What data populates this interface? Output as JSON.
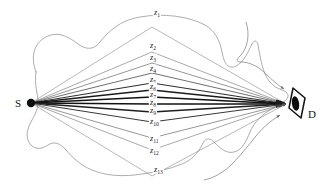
{
  "figure": {
    "type": "multipath-propagation-diagram",
    "background_color": "#ffffff",
    "ink_color": "#141414",
    "contour_color": "#8a8a8a"
  },
  "nodes": {
    "source": {
      "label": "S",
      "name": "source-node",
      "shape": "filled-dot",
      "x": 31,
      "y": 103
    },
    "destination": {
      "label": "D",
      "name": "destination-node",
      "shape": "eye-lens",
      "x": 300,
      "y": 104
    }
  },
  "paths": {
    "count": 13,
    "labels": [
      "z1",
      "z2",
      "z3",
      "z4",
      "z5",
      "z6",
      "z7",
      "z8",
      "z9",
      "z10",
      "z11",
      "z12",
      "z13"
    ],
    "label_base": "z",
    "label_subscripts": [
      "1",
      "2",
      "3",
      "4",
      "5",
      "6",
      "7",
      "8",
      "9",
      "10",
      "11",
      "12",
      "13"
    ],
    "items": [
      {
        "id": "z1",
        "base": "z",
        "sub": "1",
        "apex_y": 27,
        "label_x": 154,
        "label_y": 15,
        "width": 0.55,
        "color": "#7d7d7d"
      },
      {
        "id": "z2",
        "base": "z",
        "sub": "2",
        "apex_y": 52,
        "label_x": 150,
        "label_y": 48,
        "width": 0.6,
        "color": "#6e6e6e"
      },
      {
        "id": "z3",
        "base": "z",
        "sub": "3",
        "apex_y": 63,
        "label_x": 150,
        "label_y": 60,
        "width": 0.65,
        "color": "#5f5f5f"
      },
      {
        "id": "z4",
        "base": "z",
        "sub": "4",
        "apex_y": 73,
        "label_x": 150,
        "label_y": 71,
        "width": 0.8,
        "color": "#4a4a4a"
      },
      {
        "id": "z5",
        "base": "z",
        "sub": "5",
        "apex_y": 83,
        "label_x": 150,
        "label_y": 82,
        "width": 1.1,
        "color": "#303030"
      },
      {
        "id": "z6",
        "base": "z",
        "sub": "6",
        "apex_y": 90,
        "label_x": 150,
        "label_y": 89,
        "width": 1.5,
        "color": "#1c1c1c"
      },
      {
        "id": "z7",
        "base": "z",
        "sub": "7",
        "apex_y": 97,
        "label_x": 150,
        "label_y": 97,
        "width": 1.7,
        "color": "#121212"
      },
      {
        "id": "z8",
        "base": "z",
        "sub": "8",
        "apex_y": 104,
        "label_x": 150,
        "label_y": 105,
        "width": 1.7,
        "color": "#121212"
      },
      {
        "id": "z9",
        "base": "z",
        "sub": "9",
        "apex_y": 112,
        "label_x": 150,
        "label_y": 113,
        "width": 1.4,
        "color": "#1f1f1f"
      },
      {
        "id": "z10",
        "base": "z",
        "sub": "10",
        "apex_y": 122,
        "label_x": 150,
        "label_y": 124,
        "width": 1.0,
        "color": "#383838"
      },
      {
        "id": "z11",
        "base": "z",
        "sub": "11",
        "apex_y": 138,
        "label_x": 150,
        "label_y": 141,
        "width": 0.65,
        "color": "#5f5f5f"
      },
      {
        "id": "z12",
        "base": "z",
        "sub": "12",
        "apex_y": 150,
        "label_x": 150,
        "label_y": 153,
        "width": 0.6,
        "color": "#6e6e6e"
      },
      {
        "id": "z13",
        "base": "z",
        "sub": "13",
        "apex_y": 176,
        "label_x": 154,
        "label_y": 172,
        "width": 0.55,
        "color": "#7d7d7d"
      }
    ]
  },
  "contour": {
    "name": "scattering-region-outline",
    "stroke": "#8a8a8a",
    "stroke_width": 0.7,
    "path": "M 36 72 C 30 56, 34 42, 48 36 C 60 31, 70 38, 78 44 C 86 50, 94 50, 100 42 C 108 32, 120 20, 140 17 C 163 13, 188 16, 205 25 C 214 30, 220 40, 222 52 C 224 63, 228 70, 236 66 C 244 62, 248 52, 252 44 C 254 40, 257 40, 258 45 C 260 56, 262 68, 266 76 C 270 84, 276 88, 282 90 C 288 92, 290 96, 286 100 C 282 104, 276 106, 270 110 C 262 115, 254 122, 250 132 C 246 142, 242 150, 234 152 C 226 154, 220 148, 214 142 C 209 137, 205 138, 202 145 C 198 153, 192 160, 182 164 C 170 169, 156 172, 142 174 C 124 177, 106 176, 92 170 C 80 165, 72 157, 66 150 C 60 143, 54 141, 48 145 C 42 149, 36 150, 31 145 C 26 140, 26 132, 30 124 C 34 116, 38 110, 38 102 C 38 94, 34 84, 36 72 Z"
  },
  "annotation_arrows": [
    {
      "name": "contour-arrow-upper",
      "path": "M 246 22 C 250 34, 248 48, 240 56 C 236 60, 236 62, 241 62 C 249 62, 258 66, 266 74 C 272 80, 278 85, 284 89",
      "stroke": "#7a7a7a",
      "points_to": "destination-node"
    },
    {
      "name": "contour-arrow-lower",
      "path": "M 204 180 C 214 178, 224 172, 232 164 C 240 156, 248 146, 256 136 C 264 126, 272 120, 280 115",
      "stroke": "#7a7a7a",
      "points_to": "destination-node"
    }
  ],
  "geometry": {
    "width": 328,
    "height": 193,
    "source_x": 31,
    "source_y": 103,
    "dest_x": 286,
    "dest_y": 104,
    "apex_x": 152
  }
}
